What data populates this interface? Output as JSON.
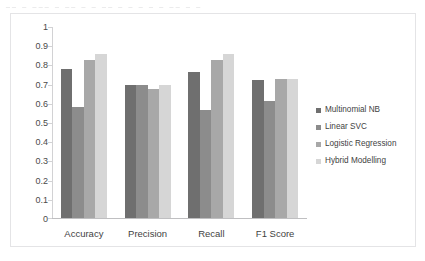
{
  "scan_artifact": {
    "text": "__  _ ___ _  __  _ _ __ _   _ _  _  _  __ _ _"
  },
  "chart_data": {
    "type": "bar",
    "title": "",
    "xlabel": "",
    "ylabel": "",
    "categories": [
      "Accuracy",
      "Precision",
      "Recall",
      "F1 Score"
    ],
    "series": [
      {
        "name": "Multinomial NB",
        "color": "#6f6f6f",
        "values": [
          0.775,
          0.695,
          0.76,
          0.72
        ]
      },
      {
        "name": "Linear SVC",
        "color": "#8c8c8c",
        "values": [
          0.58,
          0.695,
          0.56,
          0.61
        ]
      },
      {
        "name": "Logistic Regression",
        "color": "#a8a8a8",
        "values": [
          0.825,
          0.67,
          0.825,
          0.725
        ]
      },
      {
        "name": "Hybrid Modelling",
        "color": "#d6d6d6",
        "values": [
          0.855,
          0.695,
          0.855,
          0.725
        ]
      }
    ],
    "ylim": [
      0,
      1
    ],
    "yticks": [
      "0",
      "0.1",
      "0.2",
      "0.3",
      "0.4",
      "0.5",
      "0.6",
      "0.7",
      "0.8",
      "0.9",
      "1"
    ],
    "grid": false,
    "legend_position": "right"
  }
}
